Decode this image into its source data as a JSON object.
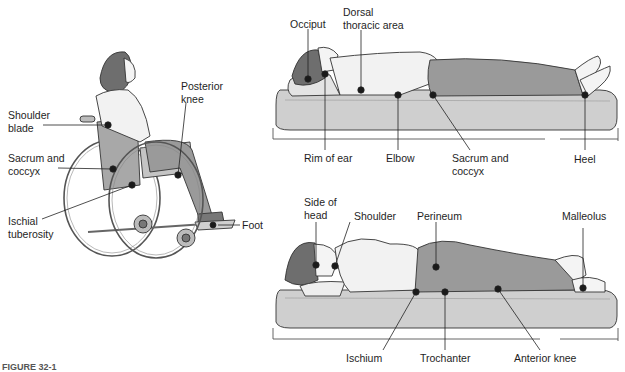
{
  "figure": {
    "caption": "FIGURE 32-1"
  },
  "colors": {
    "clothing_dark": "#9a9a9a",
    "clothing_light": "#f2f2f2",
    "mattress": "#cfcfcf",
    "hair": "#6e6e6e",
    "marker": "#1a1a1a"
  },
  "panels": [
    {
      "name": "sitting-wheelchair",
      "labels": [
        {
          "id": "shoulder_blade",
          "text": "Shoulder\nblade"
        },
        {
          "id": "sacrum_coccyx",
          "text": "Sacrum and\ncoccyx"
        },
        {
          "id": "ischial_tuberosity",
          "text": "Ischial\ntuberosity"
        },
        {
          "id": "posterior_knee",
          "text": "Posterior\nknee"
        },
        {
          "id": "foot",
          "text": "Foot"
        }
      ]
    },
    {
      "name": "supine",
      "labels": [
        {
          "id": "occiput",
          "text": "Occiput"
        },
        {
          "id": "dorsal_thoracic",
          "text": "Dorsal\nthoracic area"
        },
        {
          "id": "rim_of_ear",
          "text": "Rim of ear"
        },
        {
          "id": "elbow",
          "text": "Elbow"
        },
        {
          "id": "sacrum_coccyx",
          "text": "Sacrum and\ncoccyx"
        },
        {
          "id": "heel",
          "text": "Heel"
        }
      ]
    },
    {
      "name": "side-lying",
      "labels": [
        {
          "id": "side_of_head",
          "text": "Side of\nhead"
        },
        {
          "id": "shoulder",
          "text": "Shoulder"
        },
        {
          "id": "perineum",
          "text": "Perineum"
        },
        {
          "id": "malleolus",
          "text": "Malleolus"
        },
        {
          "id": "ischium",
          "text": "Ischium"
        },
        {
          "id": "trochanter",
          "text": "Trochanter"
        },
        {
          "id": "anterior_knee",
          "text": "Anterior knee"
        }
      ]
    }
  ]
}
